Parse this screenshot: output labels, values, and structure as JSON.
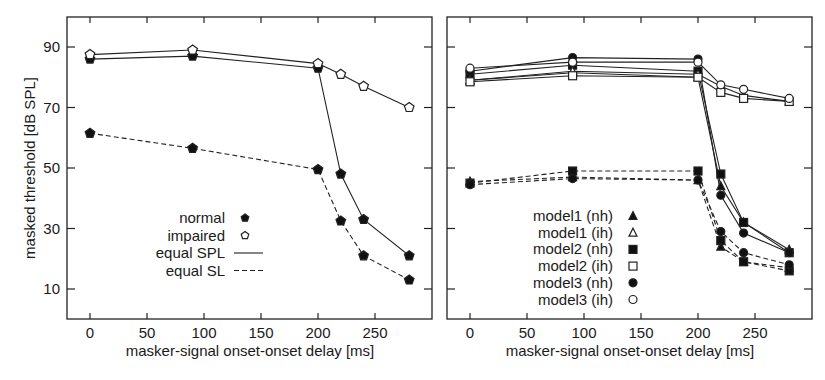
{
  "figure": {
    "ylabel": "masked threshold [dB SPL]",
    "xlabel_left": "masker-signal onset-onset delay [ms]",
    "xlabel_right": "masker-signal onset-onset delay [ms]",
    "x_ticks": [
      0,
      50,
      100,
      150,
      200,
      250
    ],
    "y_ticks": [
      10,
      30,
      50,
      70,
      90
    ]
  },
  "chart_data": [
    {
      "type": "line",
      "panel": "left",
      "title": "",
      "xlabel": "masker-signal onset-onset delay [ms]",
      "ylabel": "masked threshold [dB SPL]",
      "xlim": [
        -20,
        287
      ],
      "ylim": [
        0,
        100
      ],
      "x_ticks": [
        0,
        50,
        100,
        150,
        200,
        250
      ],
      "y_ticks": [
        10,
        30,
        50,
        70,
        90
      ],
      "grid": false,
      "legend": {
        "position": "lower-center",
        "entries": [
          {
            "label": "normal",
            "marker": "filled-pentagon"
          },
          {
            "label": "impaired",
            "marker": "open-pentagon"
          },
          {
            "label": "equal SPL",
            "line": "solid"
          },
          {
            "label": "equal SL",
            "line": "dashed"
          }
        ]
      },
      "series": [
        {
          "name": "normal, equal SPL",
          "marker": "filled",
          "line": "solid",
          "x": [
            0,
            90,
            200,
            220,
            240,
            280
          ],
          "y": [
            86,
            87,
            83,
            48,
            33,
            21
          ]
        },
        {
          "name": "impaired, equal SPL",
          "marker": "open",
          "line": "solid",
          "x": [
            0,
            90,
            200,
            220,
            240,
            280
          ],
          "y": [
            87.5,
            89,
            84.5,
            81,
            77,
            70
          ]
        },
        {
          "name": "normal, equal SL",
          "marker": "filled",
          "line": "dashed",
          "x": [
            0,
            90,
            200,
            220,
            240,
            280
          ],
          "y": [
            61.5,
            56.5,
            49.5,
            32.5,
            21,
            13
          ]
        }
      ]
    },
    {
      "type": "line",
      "panel": "right",
      "title": "",
      "xlabel": "masker-signal onset-onset delay [ms]",
      "ylabel": "",
      "xlim": [
        -20,
        287
      ],
      "ylim": [
        0,
        100
      ],
      "x_ticks": [
        0,
        50,
        100,
        150,
        200,
        250
      ],
      "y_ticks": [
        10,
        30,
        50,
        70,
        90
      ],
      "grid": false,
      "legend": {
        "position": "lower-center",
        "entries": [
          {
            "label": "model1 (nh)",
            "marker": "filled-triangle"
          },
          {
            "label": "model1  (ih)",
            "marker": "open-triangle"
          },
          {
            "label": "model2 (nh)",
            "marker": "filled-square"
          },
          {
            "label": "model2  (ih)",
            "marker": "open-square"
          },
          {
            "label": "model3 (nh)",
            "marker": "filled-circle"
          },
          {
            "label": "model3  (ih)",
            "marker": "open-circle"
          }
        ]
      },
      "series": [
        {
          "name": "model1 (nh) equal SPL",
          "marker": "filled-triangle",
          "line": "solid",
          "x": [
            0,
            90,
            200,
            220,
            240,
            280
          ],
          "y": [
            79,
            81.5,
            80,
            44,
            32,
            23
          ]
        },
        {
          "name": "model2 (nh) equal SPL",
          "marker": "filled-square",
          "line": "solid",
          "x": [
            0,
            90,
            200,
            220,
            240,
            280
          ],
          "y": [
            81,
            84,
            82,
            48,
            32,
            22
          ]
        },
        {
          "name": "model3 (nh) equal SPL",
          "marker": "filled-circle",
          "line": "solid",
          "x": [
            0,
            90,
            200,
            220,
            240,
            280
          ],
          "y": [
            82,
            86.5,
            86,
            41,
            28.5,
            22
          ]
        },
        {
          "name": "model1 (ih) equal SPL",
          "marker": "open-triangle",
          "line": "solid",
          "x": [
            0,
            90,
            200,
            220,
            240,
            280
          ],
          "y": [
            79,
            82,
            81,
            77,
            74,
            72
          ]
        },
        {
          "name": "model2 (ih) equal SPL",
          "marker": "open-square",
          "line": "solid",
          "x": [
            0,
            90,
            200,
            220,
            240,
            280
          ],
          "y": [
            78.5,
            80.5,
            80,
            75,
            73,
            72
          ]
        },
        {
          "name": "model3 (ih) equal SPL",
          "marker": "open-circle",
          "line": "solid",
          "x": [
            0,
            90,
            200,
            220,
            240,
            280
          ],
          "y": [
            83,
            85,
            85,
            77.5,
            76,
            73
          ]
        },
        {
          "name": "model1 (nh) equal SL",
          "marker": "filled-triangle",
          "line": "dashed",
          "x": [
            0,
            90,
            200,
            220,
            240,
            280
          ],
          "y": [
            45.5,
            47,
            46,
            24,
            19,
            17
          ]
        },
        {
          "name": "model2 (nh) equal SL",
          "marker": "filled-square",
          "line": "dashed",
          "x": [
            0,
            90,
            200,
            220,
            240,
            280
          ],
          "y": [
            45,
            49,
            49,
            26,
            19,
            16
          ]
        },
        {
          "name": "model3 (nh) equal SL",
          "marker": "filled-circle",
          "line": "dashed",
          "x": [
            0,
            90,
            200,
            220,
            240,
            280
          ],
          "y": [
            44.5,
            46.5,
            46,
            29,
            22,
            18
          ]
        }
      ]
    }
  ]
}
